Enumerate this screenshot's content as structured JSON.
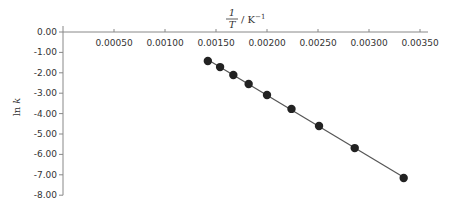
{
  "chart_data": {
    "type": "scatter",
    "title": "",
    "xlabel": "1/T / K^-1",
    "xlabel_parts": {
      "numerator": "1",
      "denominator": "T",
      "unit": "/ K",
      "exponent": "−1"
    },
    "ylabel": "ln k",
    "ylabel_parts": {
      "ln": "ln",
      "k": "k"
    },
    "xlim": [
      0,
      0.0036
    ],
    "ylim": [
      -8.0,
      0.0
    ],
    "x_ticks": [
      0.0005,
      0.001,
      0.0015,
      0.002,
      0.0025,
      0.003,
      0.0035
    ],
    "x_tick_labels": [
      "0.00050",
      "0.00100",
      "0.00150",
      "0.00200",
      "0.00250",
      "0.00300",
      "0.00350"
    ],
    "y_ticks": [
      0,
      -1,
      -2,
      -3,
      -4,
      -5,
      -6,
      -7,
      -8
    ],
    "y_tick_labels": [
      "0.00",
      "-1.00",
      "-2.00",
      "-3.00",
      "-4.00",
      "-5.00",
      "-6.00",
      "-7.00",
      "-8.00"
    ],
    "x_axis_position": "top (y = 0)",
    "grid": false,
    "legend": null,
    "series": [
      {
        "name": "data",
        "marker": "filled-circle",
        "trendline": "linear",
        "color": "#222222",
        "x": [
          0.00142,
          0.00154,
          0.00167,
          0.00182,
          0.002,
          0.00224,
          0.00251,
          0.00286,
          0.00334
        ],
        "y": [
          -1.42,
          -1.72,
          -2.11,
          -2.55,
          -3.09,
          -3.77,
          -4.61,
          -5.69,
          -7.16
        ]
      }
    ]
  },
  "colors": {
    "axis": "#888888",
    "text": "#333333",
    "marker": "#222222",
    "line": "#555555"
  }
}
